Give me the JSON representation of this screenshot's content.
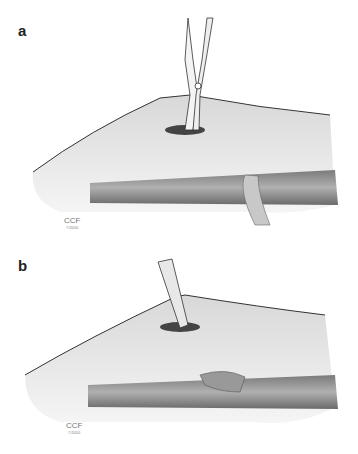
{
  "figure": {
    "panels": [
      {
        "label": "a",
        "watermark": "CCF",
        "copyright": "©2010",
        "instrument": "scissors"
      },
      {
        "label": "b",
        "watermark": "CCF",
        "copyright": "©2010",
        "instrument": "forceps"
      }
    ]
  },
  "colors": {
    "tissue": "#e6e6e6",
    "shade": "#b5b5b5",
    "outline": "#333333",
    "tendon": "#9a9a9a"
  }
}
